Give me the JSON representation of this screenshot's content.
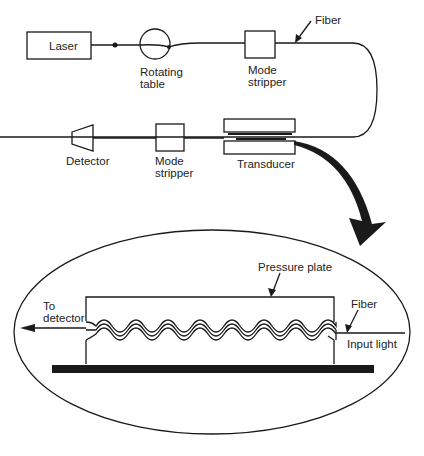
{
  "diagram": {
    "top_section": {
      "laser_label": "Laser",
      "rotating_table_label": "Rotating\ntable",
      "mode_stripper_top_label": "Mode\nstripper",
      "fiber_label": "Fiber",
      "detector_label": "Detector",
      "mode_stripper_bottom_label": "Mode\nstripper",
      "transducer_label": "Transducer"
    },
    "detail_section": {
      "pressure_plate_label": "Pressure plate",
      "to_detector_label": "To\ndetector",
      "fiber_label": "Fiber",
      "input_light_label": "Input light"
    },
    "colors": {
      "line": "#1a1a1a",
      "background": "#ffffff"
    }
  }
}
